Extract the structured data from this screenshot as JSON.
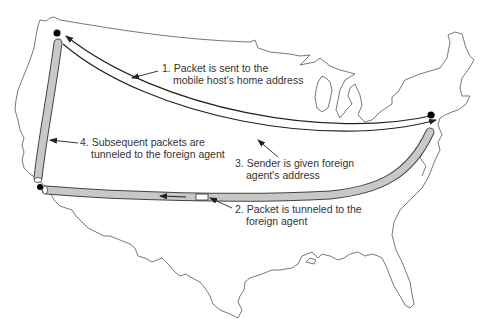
{
  "diagram": {
    "colors": {
      "map_outline": "#555555",
      "tunnel_fill": "#c8c8c8",
      "tunnel_stroke": "#444444",
      "arrow": "#222222",
      "node": "#000000",
      "text": "#333333"
    },
    "nodes": [
      {
        "id": "home",
        "name": "Mobile host's home (Seattle)"
      },
      {
        "id": "foreign",
        "name": "Foreign agent (Los Angeles)"
      },
      {
        "id": "sender",
        "name": "Sender (New York)"
      }
    ],
    "steps": [
      {
        "line1": "1. Packet is sent to the",
        "line2": "mobile host's home address"
      },
      {
        "line1": "2. Packet is tunneled to the",
        "line2": "foreign agent"
      },
      {
        "line1": "3. Sender is given foreign",
        "line2": "agent's address"
      },
      {
        "line1": "4. Subsequent packets are",
        "line2": "tunneled to the foreign agent"
      }
    ]
  }
}
